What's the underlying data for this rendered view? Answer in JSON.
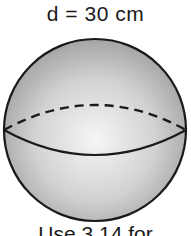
{
  "figure": {
    "shape": "sphere",
    "diameter_label": "d = 30 cm",
    "note": "Use 3.14 for",
    "colors": {
      "outline": "#1a1a1a",
      "fill_light": "#f4f4f4",
      "fill_dark": "#9c9c9c",
      "text": "#1a1a1a"
    }
  }
}
